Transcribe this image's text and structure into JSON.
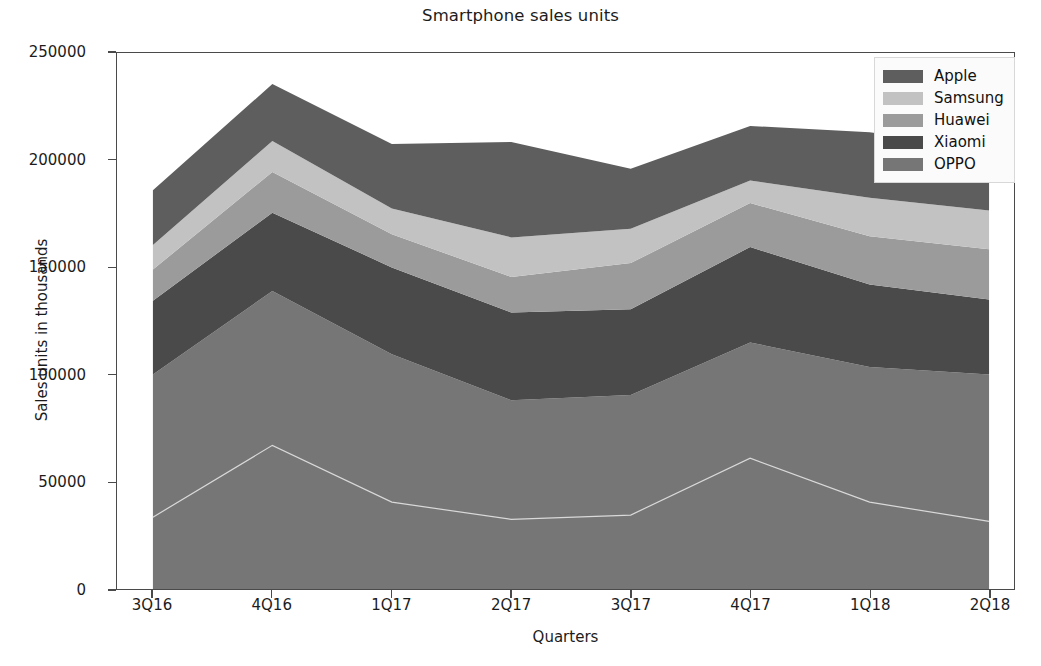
{
  "chart_data": {
    "type": "area",
    "stacked": true,
    "title": "Smartphone sales units",
    "xlabel": "Quarters",
    "ylabel": "Sales units in thousands",
    "categories": [
      "3Q16",
      "4Q16",
      "1Q17",
      "2Q17",
      "3Q17",
      "4Q17",
      "1Q18",
      "2Q18"
    ],
    "xlim": [
      "3Q16",
      "2Q18"
    ],
    "ylim": [
      0,
      250000
    ],
    "yticks": [
      0,
      50000,
      100000,
      150000,
      200000,
      250000
    ],
    "ytick_labels": [
      "0",
      "50000",
      "100000",
      "150000",
      "200000",
      "250000"
    ],
    "grid": false,
    "legend_position": "upper right",
    "stack_order_bottom_to_top": [
      "OPPO",
      "Xiaomi",
      "Huawei",
      "Samsung",
      "Apple"
    ],
    "series": [
      {
        "name": "Apple",
        "color": "#5e5e5e",
        "values": [
          25500,
          26500,
          30000,
          44500,
          28000,
          25500,
          30500,
          29000
        ]
      },
      {
        "name": "Samsung",
        "color": "#c2c2c2",
        "values": [
          11500,
          14500,
          12000,
          18500,
          16000,
          10500,
          18000,
          18000
        ]
      },
      {
        "name": "Huawei",
        "color": "#9b9b9b",
        "values": [
          14500,
          19000,
          15500,
          16500,
          21500,
          20500,
          22500,
          23500
        ]
      },
      {
        "name": "Xiaomi",
        "color": "#4a4a4a",
        "values": [
          34500,
          36500,
          40500,
          41000,
          40000,
          44500,
          38500,
          35000
        ]
      },
      {
        "name": "OPPO",
        "color": "#767676",
        "values": [
          100000,
          139000,
          109500,
          88000,
          90500,
          115000,
          103500,
          100000
        ]
      }
    ],
    "stack_boundaries_bottom_to_top": {
      "baseline": [
        0,
        0,
        0,
        0,
        0,
        0,
        0,
        0
      ],
      "oppo_top": [
        43000,
        76500,
        50000,
        42000,
        44000,
        70500,
        50000,
        41000
      ],
      "xiaomi_top": [
        115500,
        153500,
        131000,
        125000,
        129500,
        145000,
        126500,
        114500
      ],
      "huawei_top": [
        148000,
        195500,
        176500,
        163500,
        167000,
        188500,
        170000,
        165000
      ],
      "samsung_top": [
        161500,
        209000,
        190500,
        182000,
        192500,
        215500,
        194500,
        189500
      ],
      "apple_top": [
        186000,
        235500,
        207500,
        209000,
        221000,
        241500,
        226500,
        219500
      ]
    },
    "colors": {
      "apple": "#5e5e5e",
      "samsung": "#c2c2c2",
      "huawei": "#9b9b9b",
      "xiaomi": "#4a4a4a",
      "oppo": "#767676",
      "axis": "#4a4a4a",
      "text": "#1c1c1c",
      "background": "#ffffff",
      "legend_face": "#fbfbfb",
      "legend_edge": "#d8d8d8"
    }
  },
  "legend": {
    "items": [
      {
        "label": "Apple"
      },
      {
        "label": "Samsung"
      },
      {
        "label": "Huawei"
      },
      {
        "label": "Xiaomi"
      },
      {
        "label": "OPPO"
      }
    ]
  }
}
